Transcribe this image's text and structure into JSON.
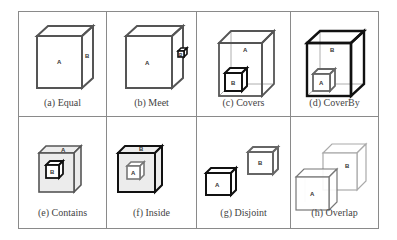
{
  "figure": {
    "cells": [
      {
        "caption": "(a) Equal",
        "relation": "Equal",
        "labels": [
          "A",
          "B"
        ]
      },
      {
        "caption": "(b) Meet",
        "relation": "Meet",
        "labels": [
          "A",
          "B"
        ]
      },
      {
        "caption": "(c) Covers",
        "relation": "Covers",
        "labels": [
          "A",
          "B"
        ]
      },
      {
        "caption": "(d) CoverBy",
        "relation": "CoverBy",
        "labels": [
          "B",
          "A"
        ]
      },
      {
        "caption": "(e) Contains",
        "relation": "Contains",
        "labels": [
          "A",
          "B"
        ]
      },
      {
        "caption": "(f) Inside",
        "relation": "Inside",
        "labels": [
          "B",
          "A"
        ]
      },
      {
        "caption": "(g) Disjoint",
        "relation": "Disjoint",
        "labels": [
          "A",
          "B"
        ]
      },
      {
        "caption": "(h) Overlap",
        "relation": "Overlap",
        "labels": [
          "A",
          "B"
        ]
      }
    ]
  }
}
